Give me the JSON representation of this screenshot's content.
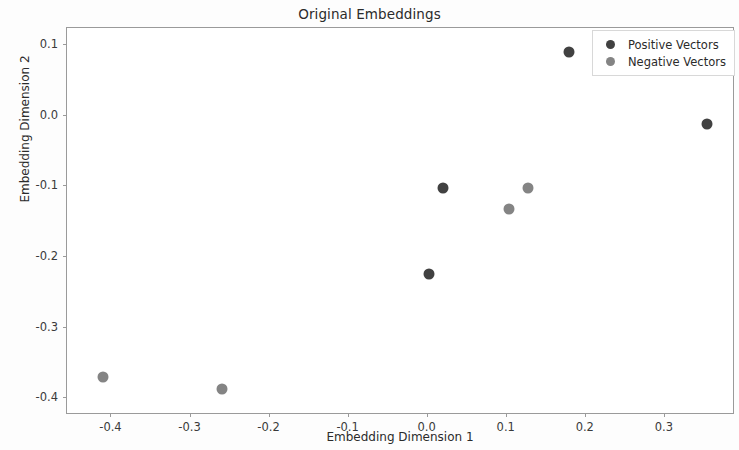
{
  "chart_data": {
    "type": "scatter",
    "title": "Original Embeddings",
    "xlabel": "Embedding Dimension 1",
    "ylabel": "Embedding Dimension 2",
    "xlim": [
      -0.455,
      0.39
    ],
    "ylim": [
      -0.425,
      0.123
    ],
    "xticks": [
      -0.4,
      -0.3,
      -0.2,
      -0.1,
      0.0,
      0.1,
      0.2,
      0.3
    ],
    "xticklabels": [
      "-0.4",
      "-0.3",
      "-0.2",
      "-0.1",
      "0.0",
      "0.1",
      "0.2",
      "0.3"
    ],
    "yticks": [
      0.1,
      0.0,
      -0.1,
      -0.2,
      -0.3,
      -0.4
    ],
    "yticklabels": [
      "0.1",
      "0.0",
      "-0.1",
      "-0.2",
      "-0.3",
      "-0.4"
    ],
    "grid": false,
    "legend_position": "upper right",
    "series": [
      {
        "name": "Positive Vectors",
        "color": "#414141",
        "points": [
          {
            "x": 0.18,
            "y": 0.089
          },
          {
            "x": 0.355,
            "y": -0.013
          },
          {
            "x": 0.021,
            "y": -0.104
          },
          {
            "x": 0.003,
            "y": -0.225
          }
        ]
      },
      {
        "name": "Negative Vectors",
        "color": "#848484",
        "points": [
          {
            "x": 0.128,
            "y": -0.103
          },
          {
            "x": 0.104,
            "y": -0.134
          },
          {
            "x": -0.41,
            "y": -0.371
          },
          {
            "x": -0.259,
            "y": -0.388
          }
        ]
      }
    ]
  }
}
